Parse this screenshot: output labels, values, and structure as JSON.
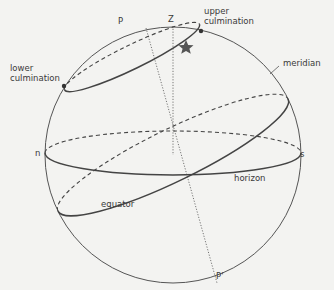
{
  "diagram": {
    "labels": {
      "P": "P",
      "P_prime": "P'",
      "Z": "Z",
      "upper_culmination_1": "upper",
      "upper_culmination_2": "culmination",
      "lower_culmination_1": "lower",
      "lower_culmination_2": "culmination",
      "meridian": "meridian",
      "n": "n",
      "s": "s",
      "horizon": "horizon",
      "equator": "equator"
    },
    "colors": {
      "line": "#4a4a4a",
      "background": "#f3f3f1",
      "star": "#555555"
    }
  }
}
